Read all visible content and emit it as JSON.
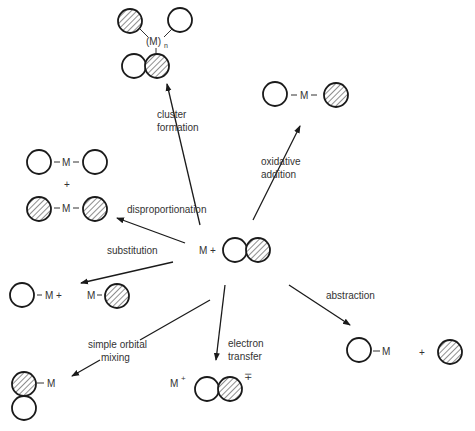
{
  "center": {
    "label": "M +"
  },
  "reactions": [
    {
      "id": "cluster-formation",
      "label_lines": [
        "cluster",
        "formation"
      ],
      "product_label": "(M)",
      "product_subscript": "n"
    },
    {
      "id": "oxidative-addition",
      "label_lines": [
        "oxidative",
        "addition"
      ],
      "product_label": "M"
    },
    {
      "id": "disproportionation",
      "label_lines": [
        "disproportionation"
      ],
      "product_label_top": "M",
      "plus": "+",
      "product_label_bottom": "M"
    },
    {
      "id": "substitution",
      "label_lines": [
        "substitution"
      ],
      "product_label_a": "M +",
      "product_label_b": "M"
    },
    {
      "id": "simple-orbital-mixing",
      "label_lines": [
        "simple orbital",
        "mixing"
      ],
      "product_label": "M"
    },
    {
      "id": "electron-transfer",
      "label_lines": [
        "electron",
        "transfer"
      ],
      "product_label": "M",
      "charge_plus": "+",
      "charge_minus": "∓"
    },
    {
      "id": "abstraction",
      "label_lines": [
        "abstraction"
      ],
      "product_label": "M",
      "plus": "+"
    }
  ],
  "colors": {
    "line": "#1a1a1a",
    "text": "#333333",
    "background": "#ffffff"
  }
}
